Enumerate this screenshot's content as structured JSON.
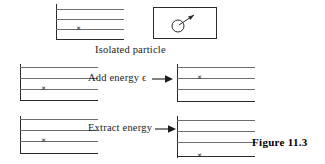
{
  "figure": {
    "label": "Figure  11.3",
    "colors": {
      "axis": "#2b2b2b",
      "level_line": "#6d6d6d",
      "text": "#1c1c1c",
      "background": "#ffffff"
    }
  },
  "captions": {
    "isolated_particle": "Isolated particle",
    "add_energy": "Add energy ϵ",
    "extract_energy": "Extract energy"
  },
  "icons": {
    "particle": "particle-with-velocity-arrow",
    "add_energy_arrow": "right-arrow",
    "extract_energy_arrow": "right-arrow"
  },
  "diagrams": [
    {
      "id": "top-left-levels",
      "name": "isolated-particle-levels",
      "level_count": 4,
      "occupied_level_index": 3,
      "description": "Energy level ladder with particle marked on third line from top"
    },
    {
      "id": "mid-left-levels",
      "name": "before-add-energy-levels",
      "level_count": 4,
      "occupied_level_index": 3,
      "description": "Particle on lower level before energy is added"
    },
    {
      "id": "mid-right-levels",
      "name": "after-add-energy-levels",
      "level_count": 4,
      "occupied_level_index": 2,
      "description": "Particle raised to higher level after energy is added"
    },
    {
      "id": "bottom-left-levels",
      "name": "before-extract-energy-levels",
      "level_count": 4,
      "occupied_level_index": 3,
      "description": "Particle on level before energy is extracted"
    },
    {
      "id": "bottom-right-levels",
      "name": "after-extract-energy-levels",
      "level_count": 4,
      "occupied_level_index": 4,
      "description": "Particle dropped to lowest level after energy is extracted"
    }
  ],
  "marks": {
    "particle_symbol": "×"
  }
}
